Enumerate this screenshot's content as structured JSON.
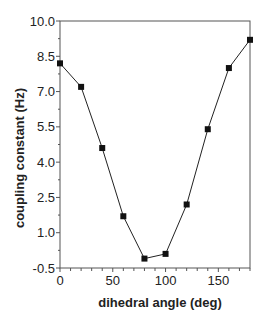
{
  "chart_data": {
    "type": "line",
    "title": "",
    "xlabel": "dihedral angle (deg)",
    "ylabel": "coupling constant (Hz)",
    "xlim": [
      0,
      180
    ],
    "ylim": [
      -0.5,
      10.0
    ],
    "x_ticks": [
      0,
      50,
      100,
      150
    ],
    "x_tick_labels": [
      "0",
      "50",
      "100",
      "150"
    ],
    "x_minor_step": 10,
    "y_ticks": [
      -0.5,
      1.0,
      2.5,
      4.0,
      5.5,
      7.0,
      8.5,
      10.0
    ],
    "y_tick_labels": [
      "-0.5",
      "1.0",
      "2.5",
      "4.0",
      "5.5",
      "7.0",
      "8.5",
      "10.0"
    ],
    "y_minor_step": 0.75,
    "grid": false,
    "legend": null,
    "marker": "square",
    "series": [
      {
        "name": "coupling constant",
        "x": [
          0,
          20,
          40,
          60,
          80,
          100,
          120,
          140,
          160,
          180
        ],
        "values": [
          8.2,
          7.2,
          4.6,
          1.7,
          -0.1,
          0.1,
          2.2,
          5.4,
          8.0,
          9.2
        ]
      }
    ]
  },
  "colors": {
    "line": "#222222",
    "marker": "#111111",
    "axis": "#555555"
  }
}
